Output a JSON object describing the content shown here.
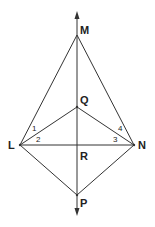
{
  "diagram": {
    "points": {
      "M": {
        "label": "M",
        "x": 77,
        "y": 35
      },
      "Q": {
        "label": "Q",
        "x": 77,
        "y": 107
      },
      "L": {
        "label": "L",
        "x": 20,
        "y": 145
      },
      "N": {
        "label": "N",
        "x": 134,
        "y": 145
      },
      "R": {
        "label": "R",
        "x": 77,
        "y": 145
      },
      "P": {
        "label": "P",
        "x": 77,
        "y": 195
      }
    },
    "angles": [
      {
        "label": "1",
        "vertex": "L"
      },
      {
        "label": "2",
        "vertex": "L"
      },
      {
        "label": "3",
        "vertex": "N"
      },
      {
        "label": "4",
        "vertex": "N"
      }
    ],
    "segments": [
      "LM",
      "MN",
      "LQ",
      "QN",
      "LN",
      "LP",
      "PN",
      "MP"
    ],
    "line": {
      "name": "MP",
      "arrows": "both"
    }
  }
}
